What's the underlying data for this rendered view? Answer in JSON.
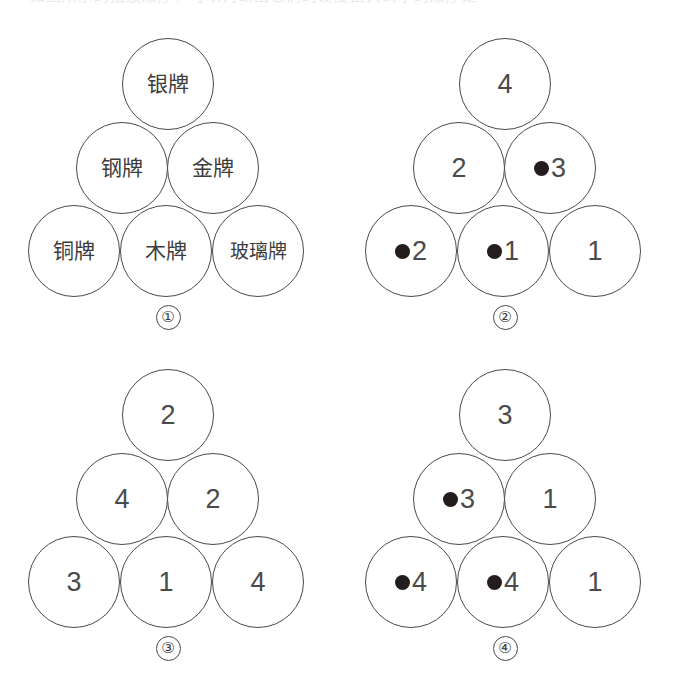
{
  "page": {
    "background_color": "#ffffff",
    "stroke_color": "#4a4a4a",
    "text_color": "#3a3a3a",
    "dot_color": "#241d1d",
    "cut_off_header_text": "如图所示的摆放顺序，可以判断出它们的硬度由大到小的顺序是"
  },
  "figures": [
    {
      "caption": "①",
      "type": "chinese-labels",
      "rows": {
        "top": [
          {
            "text": "银牌",
            "dot": false
          }
        ],
        "middle": [
          {
            "text": "钢牌",
            "dot": false
          },
          {
            "text": "金牌",
            "dot": false
          }
        ],
        "bottom": [
          {
            "text": "铜牌",
            "dot": false
          },
          {
            "text": "木牌",
            "dot": false
          },
          {
            "text": "玻璃牌",
            "dot": false
          }
        ]
      }
    },
    {
      "caption": "②",
      "type": "numbers",
      "rows": {
        "top": [
          {
            "text": "4",
            "dot": false
          }
        ],
        "middle": [
          {
            "text": "2",
            "dot": false
          },
          {
            "text": "3",
            "dot": true
          }
        ],
        "bottom": [
          {
            "text": "2",
            "dot": true
          },
          {
            "text": "1",
            "dot": true
          },
          {
            "text": "1",
            "dot": false
          }
        ]
      }
    },
    {
      "caption": "③",
      "type": "numbers",
      "rows": {
        "top": [
          {
            "text": "2",
            "dot": false
          }
        ],
        "middle": [
          {
            "text": "4",
            "dot": false
          },
          {
            "text": "2",
            "dot": false
          }
        ],
        "bottom": [
          {
            "text": "3",
            "dot": false
          },
          {
            "text": "1",
            "dot": false
          },
          {
            "text": "4",
            "dot": false
          }
        ]
      }
    },
    {
      "caption": "④",
      "type": "numbers",
      "rows": {
        "top": [
          {
            "text": "3",
            "dot": false
          }
        ],
        "middle": [
          {
            "text": "3",
            "dot": true
          },
          {
            "text": "1",
            "dot": false
          }
        ],
        "bottom": [
          {
            "text": "4",
            "dot": true
          },
          {
            "text": "4",
            "dot": true
          },
          {
            "text": "1",
            "dot": false
          }
        ]
      }
    }
  ]
}
